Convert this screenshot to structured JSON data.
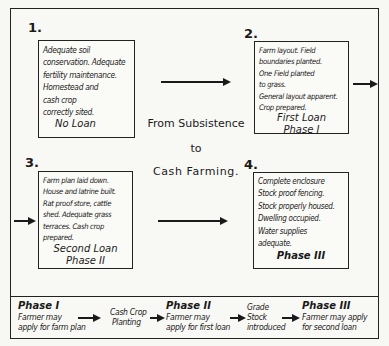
{
  "diagram": {
    "title_lines": [
      "From Subsistence",
      "to",
      "Cash Farming."
    ],
    "stages": [
      {
        "number": "1.",
        "description": "Adequate soil\nconservation. Adequate\nfertility maintenance.\nHomestead and\ncash crop\ncorrectly sited.",
        "loan": "No Loan",
        "phase": ""
      },
      {
        "number": "2.",
        "description": "Farm layout.  Field\nboundaries planted.\nOne Field planted\nto grass.\nGeneral layout apparent.\nCrop prepared.",
        "loan": "First Loan",
        "phase": "Phase I"
      },
      {
        "number": "3.",
        "description": "Farm plan laid down.\nHouse and latrine built.\nRat proof store, cattle\nshed. Adequate grass\nterraces. Cash crop\nprepared.",
        "loan": "Second Loan",
        "phase": "Phase II"
      },
      {
        "number": "4.",
        "description": "Complete enclosure\nStock proof fencing.\nStock properly housed.\nDwelling occupied.\nWater supplies\nadequate.",
        "loan": "",
        "phase": "Phase III"
      }
    ],
    "legend": [
      {
        "title": "Phase I",
        "lines": [
          "Farmer may",
          "apply for farm plan"
        ]
      },
      {
        "title": "",
        "lines": [
          "Cash Crop",
          "Planting"
        ]
      },
      {
        "title": "Phase II",
        "lines": [
          "Farmer may",
          "apply for first loan"
        ]
      },
      {
        "title": "",
        "lines": [
          "Grade",
          "Stock",
          "introduced"
        ]
      },
      {
        "title": "Phase III",
        "lines": [
          "Farmer may apply",
          "for second loan"
        ]
      }
    ]
  }
}
